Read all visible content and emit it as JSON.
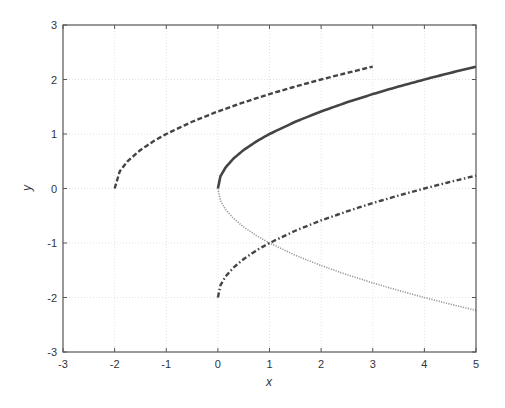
{
  "chart_data": {
    "type": "line",
    "title": "",
    "xlabel": "x",
    "ylabel": "y",
    "xlim": [
      -3,
      5
    ],
    "ylim": [
      -3,
      3
    ],
    "xticks": [
      -3,
      -2,
      -1,
      0,
      1,
      2,
      3,
      4,
      5
    ],
    "yticks": [
      -3,
      -2,
      -1,
      0,
      1,
      2,
      3
    ],
    "grid": true,
    "legend": null,
    "series": [
      {
        "name": "y = sqrt(x+2)",
        "style": "dashed",
        "color": "#444444",
        "x": [
          -2,
          -1.9,
          -1.75,
          -1.5,
          -1.25,
          -1,
          -0.5,
          0,
          0.5,
          1,
          1.5,
          2,
          2.5,
          3
        ],
        "y": [
          0,
          0.316,
          0.5,
          0.707,
          0.866,
          1.0,
          1.225,
          1.414,
          1.581,
          1.732,
          1.871,
          2.0,
          2.121,
          2.236
        ]
      },
      {
        "name": "y = sqrt(x)",
        "style": "solid",
        "color": "#444444",
        "x": [
          0,
          0.05,
          0.15,
          0.3,
          0.5,
          0.75,
          1,
          1.5,
          2,
          2.5,
          3,
          3.5,
          4,
          4.5,
          5
        ],
        "y": [
          0,
          0.224,
          0.387,
          0.548,
          0.707,
          0.866,
          1.0,
          1.225,
          1.414,
          1.581,
          1.732,
          1.871,
          2.0,
          2.121,
          2.236
        ]
      },
      {
        "name": "y = -sqrt(x)",
        "style": "dotted",
        "color": "#9a9a9a",
        "x": [
          0,
          0.05,
          0.15,
          0.3,
          0.5,
          0.75,
          1,
          1.5,
          2,
          2.5,
          3,
          3.5,
          4,
          4.5,
          5
        ],
        "y": [
          0,
          -0.224,
          -0.387,
          -0.548,
          -0.707,
          -0.866,
          -1.0,
          -1.225,
          -1.414,
          -1.581,
          -1.732,
          -1.871,
          -2.0,
          -2.121,
          -2.236
        ]
      },
      {
        "name": "y = sqrt(x) - 2",
        "style": "dashdot",
        "color": "#444444",
        "x": [
          0,
          0.05,
          0.15,
          0.3,
          0.5,
          0.75,
          1,
          1.5,
          2,
          2.5,
          3,
          3.5,
          4,
          4.5,
          5
        ],
        "y": [
          -2,
          -1.776,
          -1.613,
          -1.452,
          -1.293,
          -1.134,
          -1.0,
          -0.775,
          -0.586,
          -0.419,
          -0.268,
          -0.129,
          0,
          0.121,
          0.236
        ]
      }
    ],
    "annotations": []
  }
}
